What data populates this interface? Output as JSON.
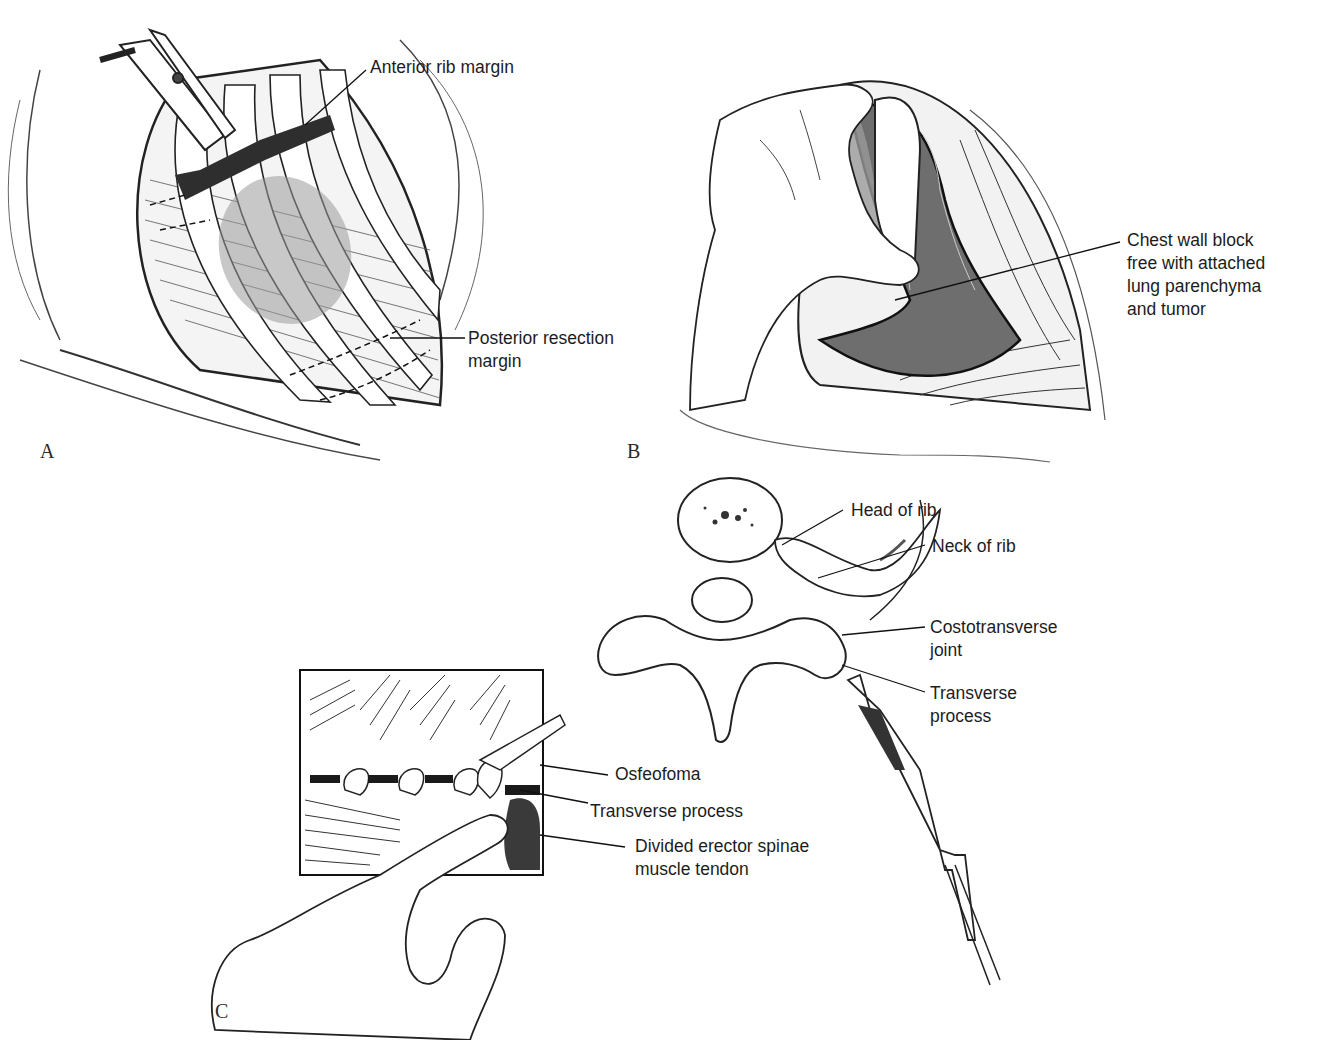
{
  "figure": {
    "panels": [
      {
        "letter": "A",
        "description": "Chest wall opened showing ribs with clamp at anterior margin and dashed resection lines",
        "labels": [
          "Anterior rib margin",
          "Posterior resection\nmargin"
        ]
      },
      {
        "letter": "B",
        "description": "Hand lifting chest wall block out of the thoracic opening",
        "labels": [
          "Chest wall block\nfree with attached\nlung parenchyma\nand tumor"
        ]
      },
      {
        "letter": "C",
        "description": "Vertebra with rib articulation and instrument; inset showing finger dissection near transverse processes",
        "labels": [
          "Head of rib",
          "Neck of rib",
          "Costotransverse\njoint",
          "Transverse\nprocess",
          "Osfeofoma",
          "Transverse process",
          "Divided erector spinae\nmuscle tendon"
        ]
      }
    ]
  },
  "colors": {
    "ink": "#1a1a1a",
    "shade": "#9a9a9a",
    "dark_tissue": "#3a3a3a",
    "background": "#ffffff"
  }
}
